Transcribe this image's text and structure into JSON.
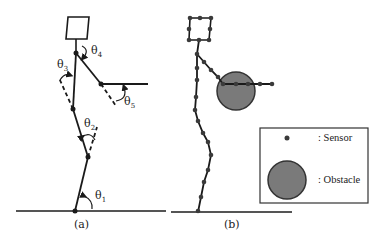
{
  "figure": {
    "panels": [
      {
        "id": "a",
        "caption": "(a)"
      },
      {
        "id": "b",
        "caption": "(b)"
      }
    ],
    "angles": [
      {
        "symbol": "θ",
        "sub": "1"
      },
      {
        "symbol": "θ",
        "sub": "2"
      },
      {
        "symbol": "θ",
        "sub": "3"
      },
      {
        "symbol": "θ",
        "sub": "4"
      },
      {
        "symbol": "θ",
        "sub": "5"
      }
    ],
    "legend": {
      "items": [
        {
          "icon": "sensor-dot-icon",
          "label": ": Sensor"
        },
        {
          "icon": "obstacle-circle-icon",
          "label": ": Obstacle"
        }
      ]
    },
    "colors": {
      "line": "#1a1a1a",
      "obstacle_fill": "#7a7a7a",
      "obstacle_stroke": "#333333",
      "sensor": "#3a3a3a",
      "ground": "#555555"
    }
  }
}
